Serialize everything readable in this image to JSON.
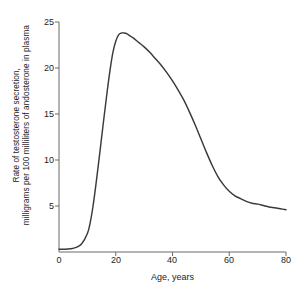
{
  "chart_data": {
    "type": "line",
    "title": "",
    "xlabel": "Age, years",
    "ylabel_line1": "Rate of testosterone secretion,",
    "ylabel_line2": "milligrams per 100 milliliters of andosterone in plasma",
    "xlim": [
      0,
      80
    ],
    "ylim": [
      0,
      25
    ],
    "xticks": [
      0,
      20,
      40,
      60,
      80
    ],
    "yticks": [
      0,
      5,
      10,
      15,
      20,
      25
    ],
    "xtick_labels": [
      "0",
      "20",
      "40",
      "60",
      "80"
    ],
    "ytick_labels": [
      "0",
      "5",
      "10",
      "15",
      "20",
      "25"
    ],
    "grid": false,
    "legend": false,
    "series": [
      {
        "name": "Rate of testosterone secretion",
        "color": "#3a3a3a",
        "x": [
          0,
          2,
          4,
          6,
          8,
          10,
          11,
          12,
          13,
          14,
          15,
          16,
          17,
          18,
          19,
          20,
          21,
          22,
          23,
          24,
          25,
          26,
          28,
          30,
          32,
          34,
          36,
          38,
          40,
          42,
          44,
          46,
          48,
          50,
          52,
          54,
          56,
          58,
          60,
          62,
          64,
          66,
          68,
          70,
          72,
          74,
          76,
          78,
          80
        ],
        "y": [
          0.3,
          0.3,
          0.35,
          0.5,
          0.9,
          2.0,
          3.2,
          5.0,
          7.3,
          9.8,
          12.4,
          15.0,
          17.5,
          19.8,
          21.7,
          22.9,
          23.6,
          23.8,
          23.8,
          23.7,
          23.5,
          23.3,
          22.8,
          22.3,
          21.7,
          21.0,
          20.3,
          19.5,
          18.6,
          17.6,
          16.5,
          15.2,
          13.8,
          12.3,
          10.8,
          9.4,
          8.2,
          7.3,
          6.6,
          6.1,
          5.8,
          5.5,
          5.3,
          5.2,
          5.05,
          4.9,
          4.8,
          4.7,
          4.6
        ]
      }
    ]
  },
  "axes": {
    "axis_color": "#6b6b6b",
    "text_color": "#1d1d1d"
  }
}
